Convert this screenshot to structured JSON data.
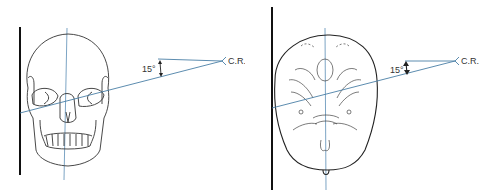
{
  "figure": {
    "panels": [
      {
        "id": "left",
        "subject": "skull-frontal-view",
        "angle_label": "15°",
        "central_ray_label": "C.R."
      },
      {
        "id": "right",
        "subject": "skull-posterior-view",
        "angle_label": "15°",
        "central_ray_label": "C.R."
      }
    ]
  },
  "colors": {
    "outline": "#222222",
    "ray": "#4a7fa6",
    "image_receptor": "#111111"
  }
}
